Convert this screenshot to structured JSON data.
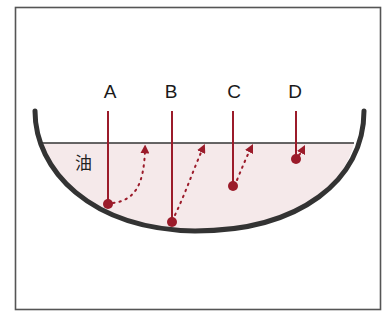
{
  "diagram": {
    "type": "frying-pan-oil-temperature-probe",
    "oil_label": "油",
    "colors": {
      "frame": "#555555",
      "pan": "#333333",
      "oil_fill": "#f5e9ea",
      "oil_surface": "#333333",
      "probe": "#9b1b2a",
      "text": "#1a1a1a"
    },
    "probes": [
      {
        "label": "A",
        "x": 108,
        "tip_y": 204,
        "arrow_to": [
          145,
          146
        ]
      },
      {
        "label": "B",
        "x": 172,
        "tip_y": 222,
        "arrow_to": [
          203,
          145
        ]
      },
      {
        "label": "C",
        "x": 233,
        "tip_y": 186,
        "arrow_to": [
          251,
          145
        ]
      },
      {
        "label": "D",
        "x": 296,
        "tip_y": 159,
        "arrow_to": [
          304,
          147
        ]
      }
    ]
  }
}
